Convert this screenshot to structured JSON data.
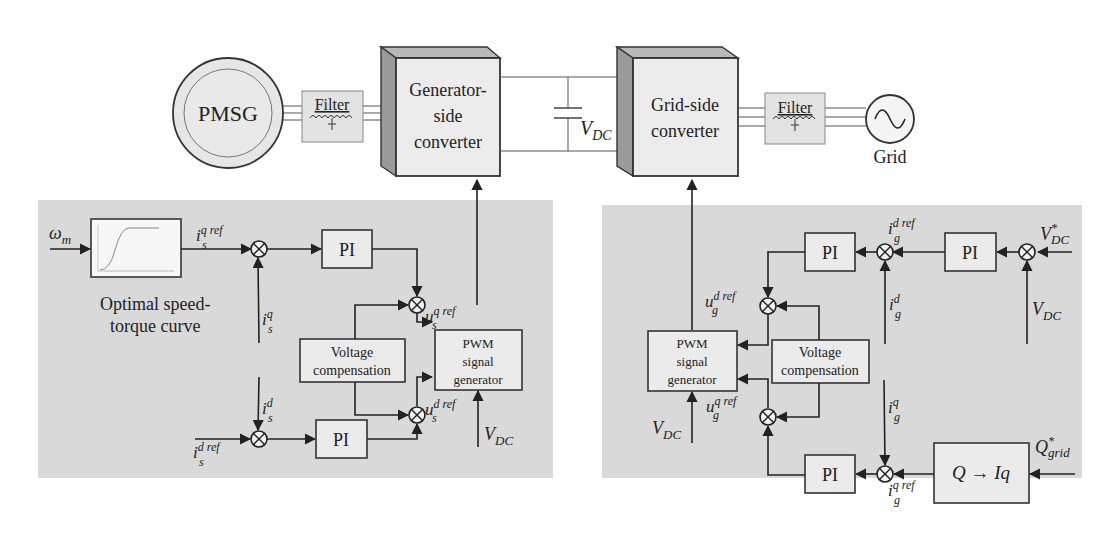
{
  "power_path": {
    "generator": {
      "label": "PMSG"
    },
    "filter_left": {
      "label": "Filter"
    },
    "gen_converter": {
      "line1": "Generator-",
      "line2": "side",
      "line3": "converter"
    },
    "dc_link": {
      "label_main": "V",
      "label_sub": "DC"
    },
    "grid_converter": {
      "line1": "Grid-side",
      "line2": "converter"
    },
    "filter_right": {
      "label": "Filter"
    },
    "grid": {
      "label": "Grid",
      "icon": "ac-source-icon"
    }
  },
  "gen_control": {
    "input_omega": {
      "main": "ω",
      "sub": "m"
    },
    "curve_block": {
      "icon": "speed-torque-curve-icon",
      "caption1": "Optimal speed-",
      "caption2": "torque curve"
    },
    "isq_ref": {
      "main": "i",
      "sup": "q ref",
      "sub": "s"
    },
    "isq": {
      "main": "i",
      "sup": "q",
      "sub": "s"
    },
    "isd": {
      "main": "i",
      "sup": "d",
      "sub": "s"
    },
    "isd_ref": {
      "main": "i",
      "sup": "d ref",
      "sub": "s"
    },
    "pi_q": {
      "label": "PI"
    },
    "pi_d": {
      "label": "PI"
    },
    "voltage_comp": {
      "line1": "Voltage",
      "line2": "compensation"
    },
    "usq_ref": {
      "main": "u",
      "sup": "q ref",
      "sub": "s"
    },
    "usd_ref": {
      "main": "u",
      "sup": "d ref",
      "sub": "s"
    },
    "pwm": {
      "line1": "PWM",
      "line2": "signal",
      "line3": "generator"
    },
    "vdc": {
      "main": "V",
      "sub": "DC"
    }
  },
  "grid_control": {
    "vdc_star": {
      "main": "V",
      "sup": "*",
      "sub": "DC"
    },
    "vdc": {
      "main": "V",
      "sub": "DC"
    },
    "pi_vdc": {
      "label": "PI"
    },
    "igd_ref": {
      "main": "i",
      "sup": "d ref",
      "sub": "g"
    },
    "igd": {
      "main": "i",
      "sup": "d",
      "sub": "g"
    },
    "pi_d": {
      "label": "PI"
    },
    "ugd_ref": {
      "main": "u",
      "sup": "d ref",
      "sub": "g"
    },
    "voltage_comp": {
      "line1": "Voltage",
      "line2": "compensation"
    },
    "pwm": {
      "line1": "PWM",
      "line2": "signal",
      "line3": "generator"
    },
    "ugq_ref": {
      "main": "u",
      "sup": "q ref",
      "sub": "g"
    },
    "vdc_pwm": {
      "main": "V",
      "sub": "DC"
    },
    "igq": {
      "main": "i",
      "sup": "q",
      "sub": "g"
    },
    "pi_q": {
      "label": "PI"
    },
    "igq_ref": {
      "main": "i",
      "sup": "q ref",
      "sub": "g"
    },
    "q_block": {
      "label": "Q → Iq"
    },
    "q_grid": {
      "main": "Q",
      "sup": "*",
      "sub": "grid"
    }
  }
}
